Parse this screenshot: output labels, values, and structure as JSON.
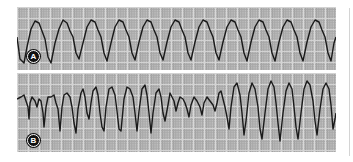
{
  "figure": {
    "colors": {
      "grid_background": "#b9b9b9",
      "grid_minor": "#9c9c9c",
      "grid_light": "#d6d6d6",
      "trace": "#1a1a1a",
      "badge_fill": "#111111",
      "badge_text": "#ffffff"
    },
    "strips": [
      {
        "id": "A",
        "label": "A",
        "pattern": "regular wide-complex tachycardia (monomorphic)",
        "trace_points": "0,30 3,52 7,56 10,40 14,22 18,14 22,16 25,24 28,32 31,50 34,56 38,36 42,22 46,13 50,16 53,24 56,30 59,46 62,52 66,36 70,20 74,13 78,15 81,23 84,30 87,46 90,54 94,36 98,20 102,13 106,15 109,23 112,30 115,46 118,53 122,35 126,20 130,13 134,15 137,23 140,30 143,46 146,53 150,35 154,20 158,13 162,15 165,23 168,30 171,46 174,53 178,35 182,20 186,13 190,15 193,23 196,30 199,46 202,53 206,35 210,20 214,13 218,15 221,23 224,30 227,46 230,54 234,35 238,20 242,13 246,15 249,23 252,30 255,46 258,54 262,35 266,20 270,13 274,15 277,23 280,30 283,46 286,54 290,35 294,20 298,13 302,15 305,23 308,30 311,46 314,54 317,36 319,30"
      },
      {
        "id": "B",
        "label": "B",
        "pattern": "polymorphic ventricular tachycardia (torsades-like, varying amplitude)",
        "trace_points": "0,26 4,24 7,22 9,28 11,34 12,46 13,30 15,24 18,28 20,34 22,26 24,28 26,40 27,54 29,34 31,24 34,24 37,22 39,30 41,36 43,58 45,34 47,22 50,20 53,24 55,34 57,50 59,60 61,36 64,20 66,16 68,24 70,40 72,46 74,30 76,18 79,14 81,22 83,40 85,54 87,58 89,34 92,16 95,14 98,22 100,38 102,56 104,58 107,26 110,14 113,16 116,24 118,40 120,58 122,38 125,16 128,12 130,22 132,40 134,60 136,40 139,20 142,16 144,24 146,40 148,48 151,32 153,20 155,24 157,28 159,38 161,30 163,24 166,26 168,30 170,36 172,44 174,32 177,24 180,28 183,34 185,42 187,30 190,24 193,28 196,32 198,38 200,30 202,20 204,18 206,26 208,34 210,44 212,56 214,34 217,14 220,10 223,22 225,40 227,62 229,48 232,20 235,10 238,16 241,34 243,56 245,66 248,40 251,16 254,8 257,14 259,30 261,50 263,68 266,40 269,18 272,10 275,16 277,34 279,54 281,66 284,40 287,16 290,8 293,12 296,28 298,48 300,62 303,36 306,16 309,10 312,16 314,32 316,56 318,46 319,40"
      }
    ]
  }
}
